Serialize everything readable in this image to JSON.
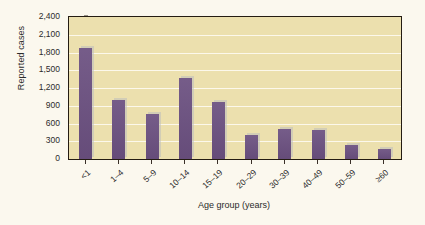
{
  "chart_data": {
    "type": "bar",
    "title": "",
    "subtitle": "",
    "xlabel": "Age group (years)",
    "ylabel": "Reported cases",
    "categories": [
      "<1",
      "1–4",
      "5–9",
      "10–14",
      "15–19",
      "20–29",
      "30–39",
      "40–49",
      "50–59",
      "≥60"
    ],
    "values": [
      1870,
      990,
      760,
      1370,
      970,
      400,
      500,
      485,
      230,
      170
    ],
    "ylim": [
      0,
      2400
    ],
    "yticks": [
      0,
      300,
      600,
      900,
      1200,
      1500,
      1800,
      2100,
      2400
    ],
    "ytick_labels": [
      "0",
      "300",
      "600",
      "900",
      "1,200",
      "1,500",
      "1,800",
      "2,100",
      "2,400"
    ],
    "grid": "horizontal",
    "legend": "none",
    "series": [
      {
        "name": "Reported cases",
        "values": [
          1870,
          990,
          760,
          1370,
          970,
          400,
          500,
          485,
          230,
          170
        ]
      }
    ],
    "colors": {
      "bar": "#6b5080",
      "plot_background": "#ece0ae",
      "page_background": "#fbf8ee",
      "gridline": "#fdfaf0",
      "axis": "#241c12",
      "text": "#2b2b2b"
    }
  }
}
